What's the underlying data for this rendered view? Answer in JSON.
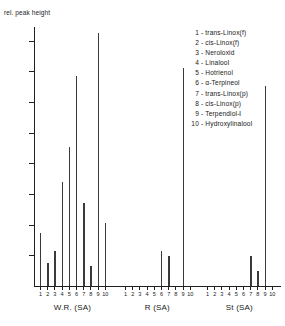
{
  "axis": {
    "y_label": "rel. peak height",
    "y_tick_count": 8
  },
  "legend": {
    "items": [
      {
        "num": "1",
        "sep": "-",
        "name": "trans-Linox(f)"
      },
      {
        "num": "2",
        "sep": "-",
        "name": "cis-Linox(f)"
      },
      {
        "num": "3",
        "sep": "-",
        "name": "Neroloxid"
      },
      {
        "num": "4",
        "sep": "-",
        "name": "Linalool"
      },
      {
        "num": "5",
        "sep": "-",
        "name": "Hotrienol"
      },
      {
        "num": "6",
        "sep": "-",
        "name": "α-Terpineol"
      },
      {
        "num": "7",
        "sep": "-",
        "name": "trans-Linox(p)"
      },
      {
        "num": "8",
        "sep": "-",
        "name": "cis-Linox(p)"
      },
      {
        "num": "9",
        "sep": "-",
        "name": "Terpendiol-Ⅰ"
      },
      {
        "num": "10",
        "sep": "-",
        "name": "Hydroxylinalool"
      }
    ]
  },
  "chart_data": {
    "type": "bar",
    "title": "",
    "xlabel": "",
    "ylabel": "rel. peak height",
    "grid": false,
    "legend_position": "top-right",
    "categories": [
      "1",
      "2",
      "3",
      "4",
      "5",
      "6",
      "7",
      "8",
      "9",
      "10"
    ],
    "category_names": [
      "trans-Linox(f)",
      "cis-Linox(f)",
      "Neroloxid",
      "Linalool",
      "Hotrienol",
      "α-Terpineol",
      "trans-Linox(p)",
      "cis-Linox(p)",
      "Terpendiol-Ⅰ",
      "Hydroxylinalool"
    ],
    "ylim": [
      0,
      100
    ],
    "y_axis_ticks_unlabeled": true,
    "groups": [
      {
        "label": "W.R.  (SA)",
        "short": "W.R.",
        "qualifier": "(SA)",
        "values": [
          21,
          9,
          14,
          41,
          55,
          83,
          33,
          8,
          100,
          25
        ]
      },
      {
        "label": "R  (SA)",
        "short": "R",
        "qualifier": "(SA)",
        "values": [
          0,
          0,
          0,
          0,
          0,
          14,
          12,
          0,
          86,
          0
        ]
      },
      {
        "label": "St  (SA)",
        "short": "St",
        "qualifier": "(SA)",
        "values": [
          0,
          0,
          0,
          0,
          0,
          0,
          12,
          6,
          79,
          0
        ]
      }
    ],
    "series": [
      {
        "name": "W.R.  (SA)",
        "values": [
          21,
          9,
          14,
          41,
          55,
          83,
          33,
          8,
          100,
          25
        ]
      },
      {
        "name": "R  (SA)",
        "values": [
          0,
          0,
          0,
          0,
          0,
          14,
          12,
          0,
          86,
          0
        ]
      },
      {
        "name": "St  (SA)",
        "values": [
          0,
          0,
          0,
          0,
          0,
          0,
          12,
          6,
          79,
          0
        ]
      }
    ]
  },
  "layout": {
    "plot_top_y": 27,
    "baseline_y": 286,
    "plot_height_px": 259,
    "group_origins_px": [
      40,
      125,
      207
    ],
    "bar_spacing_px": 7.2,
    "value_to_px": 1.6
  },
  "colors": {
    "bar": "#3a3a3a",
    "axis": "#1f1f1f",
    "text": "#202020",
    "background": "#ffffff"
  }
}
